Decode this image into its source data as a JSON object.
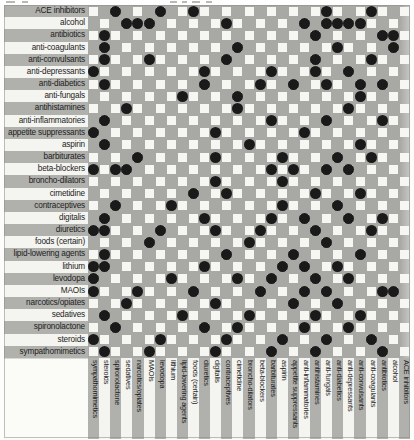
{
  "legend": {
    "dot_color": "#1a1a1a",
    "grid_color": "#a8a8a4",
    "cell_color": "#f6f6f2",
    "label_band_odd": "#b0b0ac",
    "label_band_even": "#f4f4f0"
  },
  "chart_data": {
    "type": "heatmap",
    "xlabel": "",
    "ylabel": "",
    "grid": true,
    "legend_position": "none",
    "note": "Symmetric drug-drug interaction matrix. Rows listed top-to-bottom alphabetically; columns listed left-to-right in reverse of the row order. A filled black dot marks an interaction between the row drug and the column drug.",
    "rows": [
      "ACE inhibitors",
      "alcohol",
      "antibiotics",
      "anti-coagulants",
      "anti-convulsants",
      "anti-depressants",
      "anti-diabetics",
      "anti-fungals",
      "antihistamines",
      "anti-inflammatories",
      "appetite suppressants",
      "aspirin",
      "barbiturates",
      "beta-blockers",
      "broncho-dilators",
      "cimetidine",
      "contraceptives",
      "digitalis",
      "diuretics",
      "foods (certain)",
      "lipid-lowering agents",
      "lithium",
      "levodopa",
      "MAOIs",
      "narcotics/opiates",
      "sedatives",
      "spironolactone",
      "steroids",
      "sympathomimetics"
    ],
    "categories": [
      "sympathomimetics",
      "steroids",
      "spironolactone",
      "sedatives",
      "narcotics/opiates",
      "MAOIs",
      "levodopa",
      "lithium",
      "lipid-lowering agents",
      "foods (certain)",
      "diuretics",
      "digitalis",
      "contraceptives",
      "cimetidine",
      "broncho-dilators",
      "beta-blockers",
      "barbiturates",
      "aspirin",
      "appetite suppressants",
      "anti-inflammatories",
      "antihistamines",
      "anti-fungals",
      "anti-diabetics",
      "anti-depressants",
      "anti-convulsants",
      "anti-coagulants",
      "antibiotics",
      "alcohol",
      "ACE inhibitors"
    ],
    "rows_displayed": [
      "ACE inhibitors",
      "alcohol",
      "antibiotics",
      "anti-coagulants",
      "anti-convulsants",
      "anti-depressants",
      "anti-diabetics",
      "anti-fungals",
      "antihistamines",
      "anti-inflammatories",
      "appetite suppressants",
      "aspirin",
      "barbiturates",
      "beta-blockers",
      "broncho-dilators",
      "cimetidine",
      "contraceptives",
      "digitalis",
      "diuretics",
      "foods (certain)",
      "lipid-lowering agents",
      "lithium",
      "levodopa",
      "MAOIs",
      "narcotics/opiates",
      "sedatives",
      "spironolactone",
      "steroids",
      "sympathomimetics"
    ],
    "columns_displayed": [
      "sympathomimetics",
      "steroids",
      "spironolactone",
      "sedatives",
      "narcotics/opiates",
      "MAOIs",
      "levodopa",
      "lithium",
      "lipid-lowering agents",
      "foods (certain)",
      "diuretics",
      "digitalis",
      "contraceptives",
      "cimetidine",
      "broncho-dilators",
      "beta-blockers",
      "barbiturates",
      "aspirin",
      "appetite suppressants",
      "anti-inflammatories",
      "antihistamines",
      "anti-fungals",
      "anti-diabetics",
      "anti-depressants",
      "anti-convulsants",
      "anti-coagulants",
      "antibiotics",
      "alcohol",
      "ACE inhibitors"
    ],
    "interactions": [
      [
        0,
        2
      ],
      [
        0,
        6
      ],
      [
        0,
        9
      ],
      [
        0,
        21
      ],
      [
        0,
        25
      ],
      [
        1,
        3
      ],
      [
        1,
        4
      ],
      [
        1,
        5
      ],
      [
        1,
        12
      ],
      [
        1,
        19
      ],
      [
        1,
        21
      ],
      [
        1,
        22
      ],
      [
        1,
        23
      ],
      [
        1,
        24
      ],
      [
        2,
        1
      ],
      [
        2,
        20
      ],
      [
        2,
        26
      ],
      [
        2,
        27
      ],
      [
        3,
        1
      ],
      [
        3,
        13
      ],
      [
        3,
        22
      ],
      [
        3,
        27
      ],
      [
        4,
        1
      ],
      [
        4,
        5
      ],
      [
        4,
        12
      ],
      [
        4,
        20
      ],
      [
        4,
        25
      ],
      [
        5,
        0
      ],
      [
        5,
        10
      ],
      [
        5,
        16
      ],
      [
        5,
        20
      ],
      [
        5,
        23
      ],
      [
        6,
        1
      ],
      [
        6,
        10
      ],
      [
        6,
        15
      ],
      [
        6,
        18
      ],
      [
        6,
        21
      ],
      [
        6,
        24
      ],
      [
        6,
        26
      ],
      [
        7,
        8
      ],
      [
        7,
        13
      ],
      [
        7,
        24
      ],
      [
        8,
        3
      ],
      [
        8,
        13
      ],
      [
        8,
        23
      ],
      [
        9,
        1
      ],
      [
        9,
        16
      ],
      [
        9,
        21
      ],
      [
        9,
        26
      ],
      [
        10,
        0
      ],
      [
        10,
        11
      ],
      [
        10,
        19
      ],
      [
        11,
        1
      ],
      [
        11,
        14
      ],
      [
        11,
        24
      ],
      [
        12,
        4
      ],
      [
        12,
        11
      ],
      [
        12,
        17
      ],
      [
        12,
        22
      ],
      [
        12,
        25
      ],
      [
        13,
        0
      ],
      [
        13,
        2
      ],
      [
        13,
        3
      ],
      [
        13,
        16
      ],
      [
        13,
        18
      ],
      [
        13,
        21
      ],
      [
        13,
        23
      ],
      [
        14,
        11
      ],
      [
        14,
        17
      ],
      [
        15,
        9
      ],
      [
        15,
        12
      ],
      [
        15,
        20
      ],
      [
        15,
        24
      ],
      [
        16,
        2
      ],
      [
        16,
        7
      ],
      [
        16,
        17
      ],
      [
        16,
        22
      ],
      [
        17,
        1
      ],
      [
        17,
        10
      ],
      [
        17,
        16
      ],
      [
        17,
        19
      ],
      [
        17,
        23
      ],
      [
        17,
        26
      ],
      [
        18,
        0
      ],
      [
        18,
        1
      ],
      [
        18,
        6
      ],
      [
        18,
        11
      ],
      [
        18,
        15
      ],
      [
        18,
        20
      ],
      [
        18,
        25
      ],
      [
        19,
        5
      ],
      [
        19,
        14
      ],
      [
        19,
        21
      ],
      [
        20,
        1
      ],
      [
        20,
        12
      ],
      [
        20,
        18
      ],
      [
        20,
        24
      ],
      [
        21,
        0
      ],
      [
        21,
        1
      ],
      [
        21,
        10
      ],
      [
        21,
        17
      ],
      [
        21,
        19
      ],
      [
        21,
        22
      ],
      [
        22,
        0
      ],
      [
        22,
        7
      ],
      [
        22,
        13
      ],
      [
        22,
        16
      ],
      [
        22,
        20
      ],
      [
        22,
        23
      ],
      [
        23,
        0
      ],
      [
        23,
        4
      ],
      [
        23,
        9
      ],
      [
        23,
        15
      ],
      [
        23,
        19
      ],
      [
        23,
        21
      ],
      [
        23,
        26
      ],
      [
        23,
        27
      ],
      [
        24,
        3
      ],
      [
        24,
        11
      ],
      [
        24,
        18
      ],
      [
        24,
        22
      ],
      [
        25,
        1
      ],
      [
        25,
        8
      ],
      [
        25,
        14
      ],
      [
        25,
        20
      ],
      [
        25,
        24
      ],
      [
        26,
        2
      ],
      [
        26,
        10
      ],
      [
        26,
        13
      ],
      [
        26,
        19
      ],
      [
        26,
        23
      ],
      [
        27,
        0
      ],
      [
        27,
        6
      ],
      [
        27,
        12
      ],
      [
        27,
        17
      ],
      [
        27,
        21
      ],
      [
        27,
        25
      ],
      [
        28,
        1
      ],
      [
        28,
        5
      ],
      [
        28,
        11
      ],
      [
        28,
        16
      ],
      [
        28,
        20
      ],
      [
        28,
        26
      ]
    ]
  }
}
